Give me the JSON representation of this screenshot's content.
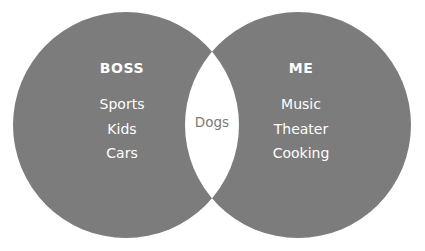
{
  "diagram": {
    "type": "venn",
    "sets": [
      {
        "id": "left",
        "title": "BOSS",
        "items": [
          "Sports",
          "Kids",
          "Cars"
        ],
        "fill_color": "#7c7c7c",
        "text_color": "#ffffff",
        "center_x": 126,
        "center_y": 125,
        "radius": 113
      },
      {
        "id": "right",
        "title": "ME",
        "items": [
          "Music",
          "Theater",
          "Cooking"
        ],
        "fill_color": "#7c7c7c",
        "text_color": "#ffffff",
        "center_x": 298,
        "center_y": 125,
        "radius": 113
      }
    ],
    "intersection": {
      "label": "Dogs",
      "fill_color": "#ffffff",
      "text_color": "#7a7a7a"
    },
    "background_color": "#ffffff"
  }
}
